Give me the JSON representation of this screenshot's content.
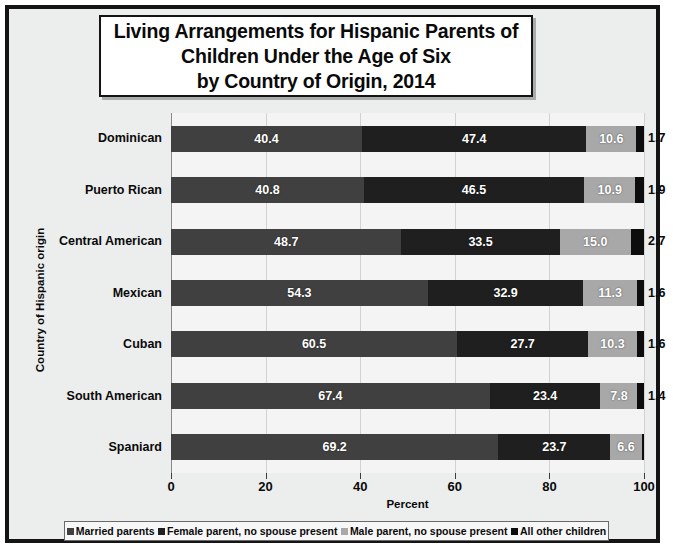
{
  "title": {
    "line1": "Living Arrangements for Hispanic Parents of",
    "line2": "Children Under the Age of Six",
    "line3": "by Country of Origin, 2014"
  },
  "axes": {
    "y_title": "Country of Hispanic origin",
    "x_title": "Percent",
    "x_ticks": [
      "0",
      "20",
      "40",
      "60",
      "80",
      "100"
    ]
  },
  "legend": {
    "items": [
      {
        "label": "Married parents",
        "color": "#404040"
      },
      {
        "label": "Female parent, no spouse present",
        "color": "#1f1f1f"
      },
      {
        "label": "Male parent, no spouse present",
        "color": "#a8a8a8"
      },
      {
        "label": "All other children",
        "color": "#0d0d0d"
      }
    ]
  },
  "chart_data": {
    "type": "bar",
    "orientation": "horizontal",
    "stacked": true,
    "title": "Living Arrangements for Hispanic Parents of Children Under the Age of Six by Country of Origin, 2014",
    "xlabel": "Percent",
    "ylabel": "Country of Hispanic origin",
    "xlim": [
      0,
      100
    ],
    "xticks": [
      0,
      20,
      40,
      60,
      80,
      100
    ],
    "grid": true,
    "legend_position": "bottom",
    "categories": [
      "Dominican",
      "Puerto Rican",
      "Central American",
      "Mexican",
      "Cuban",
      "South American",
      "Spaniard"
    ],
    "series": [
      {
        "name": "Married parents",
        "color": "#404040",
        "values": [
          40.4,
          40.8,
          48.7,
          54.3,
          60.5,
          67.4,
          69.2
        ]
      },
      {
        "name": "Female parent, no spouse present",
        "color": "#1f1f1f",
        "values": [
          47.4,
          46.5,
          33.5,
          32.9,
          27.7,
          23.4,
          23.7
        ]
      },
      {
        "name": "Male parent, no spouse present",
        "color": "#a8a8a8",
        "values": [
          10.6,
          10.9,
          15.0,
          11.3,
          10.3,
          7.8,
          6.6
        ]
      },
      {
        "name": "All other children",
        "color": "#0d0d0d",
        "values": [
          1.7,
          1.9,
          2.7,
          1.6,
          1.6,
          1.4,
          0.5
        ]
      }
    ],
    "outside_labels": [
      "1.7",
      "1.9",
      "2.7",
      "1.6",
      "1.6",
      "1.4",
      ""
    ],
    "value_label_format": "one-decimal"
  }
}
